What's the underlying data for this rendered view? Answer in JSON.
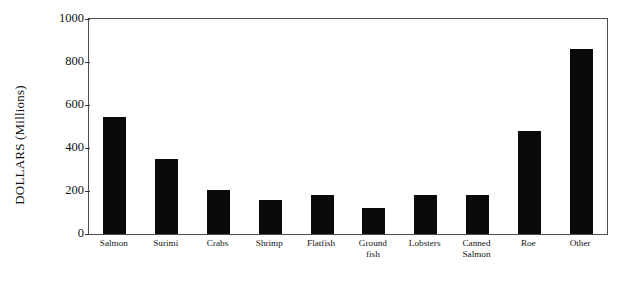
{
  "chart_data": {
    "type": "bar",
    "title": "",
    "xlabel": "",
    "ylabel": "DOLLARS (Millions)",
    "categories": [
      "Salmon",
      "Surimi",
      "Crabs",
      "Shrimp",
      "Flatfish",
      "Ground\nfish",
      "Lobsters",
      "Canned\nSalmon",
      "Roe",
      "Other"
    ],
    "values": [
      545,
      350,
      205,
      160,
      180,
      120,
      180,
      180,
      478,
      860
    ],
    "ylim": [
      0,
      1000
    ],
    "yticks": [
      0,
      200,
      400,
      600,
      800,
      1000
    ],
    "ytick_labels": [
      "0",
      "200",
      "400",
      "600",
      "800",
      "1000"
    ],
    "grid": false,
    "legend": false,
    "bar_color": "#090909",
    "frame_color": "#4d4d4d",
    "background": "#ffffff"
  }
}
